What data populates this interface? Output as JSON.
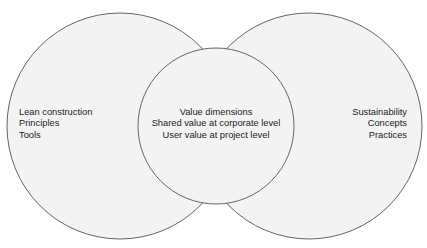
{
  "diagram": {
    "type": "venn",
    "circles": [
      {
        "id": "left",
        "lines": [
          "Lean construction",
          "Principles",
          "Tools"
        ]
      },
      {
        "id": "middle",
        "lines": [
          "Value dimensions",
          "Shared value at corporate level",
          "User value at project level"
        ]
      },
      {
        "id": "right",
        "lines": [
          "Sustainability",
          "Concepts",
          "Practices"
        ]
      }
    ],
    "colors": {
      "fill": "#f2f2f2",
      "stroke": "#555555",
      "text": "#222222"
    }
  }
}
